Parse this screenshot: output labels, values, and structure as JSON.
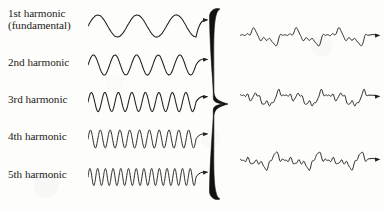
{
  "figure": {
    "background_color": "#fdfdfb",
    "ink_color": "#211f1d",
    "width": 383,
    "height": 210
  },
  "labels": [
    {
      "id": "harmonic-1",
      "line1": "1st harmonic",
      "line2": "(fundamental)",
      "x": 8,
      "y": 8
    },
    {
      "id": "harmonic-2",
      "line1": "2nd harmonic",
      "line2": "",
      "x": 8,
      "y": 57
    },
    {
      "id": "harmonic-3",
      "line1": "3rd harmonic",
      "line2": "",
      "x": 8,
      "y": 94
    },
    {
      "id": "harmonic-4",
      "line1": "4th harmonic",
      "line2": "",
      "x": 8,
      "y": 131
    },
    {
      "id": "harmonic-5",
      "line1": "5th harmonic",
      "line2": "",
      "x": 8,
      "y": 169
    }
  ],
  "brace": {
    "name": "right-curly-brace",
    "orientation": "right-facing",
    "x": 204,
    "y": 6,
    "width": 30,
    "height": 196
  },
  "chart_data": {
    "type": "line",
    "xlabel": "",
    "ylabel": "",
    "grid": false,
    "legend": "none",
    "input_waves": [
      {
        "name": "1st harmonic (fundamental)",
        "label": "1st harmonic",
        "cycles": 2.75,
        "amplitude": 11,
        "phase": 0,
        "x": 88,
        "y": 10,
        "width": 108,
        "height": 32,
        "arrow": true
      },
      {
        "name": "2nd harmonic",
        "label": "2nd harmonic",
        "cycles": 5,
        "amplitude": 10,
        "phase": 0,
        "x": 88,
        "y": 50,
        "width": 108,
        "height": 30,
        "arrow": true
      },
      {
        "name": "3rd harmonic",
        "label": "3rd harmonic",
        "cycles": 8,
        "amplitude": 9.5,
        "phase": 0,
        "x": 88,
        "y": 87,
        "width": 108,
        "height": 30,
        "arrow": true
      },
      {
        "name": "4th harmonic",
        "label": "4th harmonic",
        "cycles": 11,
        "amplitude": 9,
        "phase": 0,
        "x": 88,
        "y": 124,
        "width": 108,
        "height": 30,
        "arrow": true
      },
      {
        "name": "5th harmonic",
        "label": "5th harmonic",
        "cycles": 14,
        "amplitude": 8.5,
        "phase": 0,
        "x": 88,
        "y": 162,
        "width": 108,
        "height": 30,
        "arrow": true
      }
    ],
    "composite_waves": [
      {
        "name": "composite-wave-top",
        "components": [
          {
            "harmonic": 1,
            "amplitude": 5.0
          },
          {
            "harmonic": 3,
            "amplitude": 3.0
          },
          {
            "harmonic": 5,
            "amplitude": 1.6
          },
          {
            "harmonic": 8,
            "amplitude": 0.9
          }
        ],
        "x": 240,
        "y": 22,
        "width": 128,
        "height": 30,
        "arrow": true
      },
      {
        "name": "composite-wave-middle",
        "components": [
          {
            "harmonic": 1,
            "amplitude": 4.0
          },
          {
            "harmonic": 2,
            "amplitude": 3.2
          },
          {
            "harmonic": 4,
            "amplitude": 2.4
          },
          {
            "harmonic": 7,
            "amplitude": 1.5
          },
          {
            "harmonic": 11,
            "amplitude": 0.8
          }
        ],
        "x": 240,
        "y": 82,
        "width": 128,
        "height": 32,
        "arrow": true
      },
      {
        "name": "composite-wave-bottom",
        "components": [
          {
            "harmonic": 1,
            "amplitude": 3.6
          },
          {
            "harmonic": 2,
            "amplitude": 3.0
          },
          {
            "harmonic": 3,
            "amplitude": 2.6
          },
          {
            "harmonic": 6,
            "amplitude": 1.8
          },
          {
            "harmonic": 10,
            "amplitude": 1.0
          }
        ],
        "x": 240,
        "y": 145,
        "width": 128,
        "height": 32,
        "arrow": true
      }
    ]
  }
}
